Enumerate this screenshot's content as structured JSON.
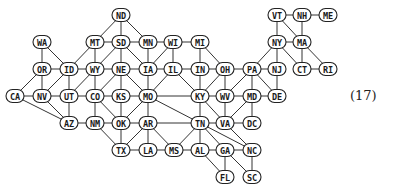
{
  "diagram": {
    "title": "",
    "equation_label": "(17)",
    "style": {
      "node_fill": "#ffffff",
      "node_stroke": "#222222",
      "edge_color": "#333333",
      "text_color": "#1a1a1a"
    },
    "nodes": [
      {
        "id": "ND",
        "x": 121,
        "y": 15
      },
      {
        "id": "WA",
        "x": 42,
        "y": 42
      },
      {
        "id": "MT",
        "x": 95,
        "y": 42
      },
      {
        "id": "SD",
        "x": 121,
        "y": 42
      },
      {
        "id": "MN",
        "x": 148,
        "y": 42
      },
      {
        "id": "WI",
        "x": 173,
        "y": 42
      },
      {
        "id": "MI",
        "x": 200,
        "y": 42
      },
      {
        "id": "VT",
        "x": 277,
        "y": 15
      },
      {
        "id": "NH",
        "x": 302,
        "y": 15
      },
      {
        "id": "ME",
        "x": 328,
        "y": 15
      },
      {
        "id": "NY",
        "x": 277,
        "y": 42
      },
      {
        "id": "MA",
        "x": 302,
        "y": 42
      },
      {
        "id": "OR",
        "x": 42,
        "y": 69
      },
      {
        "id": "ID",
        "x": 69,
        "y": 69
      },
      {
        "id": "WY",
        "x": 95,
        "y": 69
      },
      {
        "id": "NE",
        "x": 121,
        "y": 69
      },
      {
        "id": "IA",
        "x": 148,
        "y": 69
      },
      {
        "id": "IL",
        "x": 173,
        "y": 69
      },
      {
        "id": "IN",
        "x": 200,
        "y": 69
      },
      {
        "id": "OH",
        "x": 225,
        "y": 69
      },
      {
        "id": "PA",
        "x": 252,
        "y": 69
      },
      {
        "id": "NJ",
        "x": 277,
        "y": 69
      },
      {
        "id": "CT",
        "x": 302,
        "y": 69
      },
      {
        "id": "RI",
        "x": 328,
        "y": 69
      },
      {
        "id": "CA",
        "x": 15,
        "y": 96
      },
      {
        "id": "NV",
        "x": 42,
        "y": 96
      },
      {
        "id": "UT",
        "x": 69,
        "y": 96
      },
      {
        "id": "CO",
        "x": 95,
        "y": 96
      },
      {
        "id": "KS",
        "x": 121,
        "y": 96
      },
      {
        "id": "MO",
        "x": 148,
        "y": 96
      },
      {
        "id": "KY",
        "x": 200,
        "y": 96
      },
      {
        "id": "WV",
        "x": 225,
        "y": 96
      },
      {
        "id": "MD",
        "x": 252,
        "y": 96
      },
      {
        "id": "DE",
        "x": 277,
        "y": 96
      },
      {
        "id": "AZ",
        "x": 69,
        "y": 123
      },
      {
        "id": "NM",
        "x": 95,
        "y": 123
      },
      {
        "id": "OK",
        "x": 121,
        "y": 123
      },
      {
        "id": "AR",
        "x": 148,
        "y": 123
      },
      {
        "id": "TN",
        "x": 200,
        "y": 123
      },
      {
        "id": "VA",
        "x": 225,
        "y": 123
      },
      {
        "id": "DC",
        "x": 252,
        "y": 123
      },
      {
        "id": "TX",
        "x": 121,
        "y": 150
      },
      {
        "id": "LA",
        "x": 148,
        "y": 150
      },
      {
        "id": "MS",
        "x": 174,
        "y": 150
      },
      {
        "id": "AL",
        "x": 200,
        "y": 150
      },
      {
        "id": "GA",
        "x": 225,
        "y": 150
      },
      {
        "id": "NC",
        "x": 252,
        "y": 150
      },
      {
        "id": "FL",
        "x": 225,
        "y": 177
      },
      {
        "id": "SC",
        "x": 252,
        "y": 177
      }
    ],
    "edges": [
      [
        "ND",
        "MT"
      ],
      [
        "ND",
        "SD"
      ],
      [
        "ND",
        "MN"
      ],
      [
        "WA",
        "OR"
      ],
      [
        "WA",
        "ID"
      ],
      [
        "MT",
        "SD"
      ],
      [
        "MT",
        "ID"
      ],
      [
        "MT",
        "WY"
      ],
      [
        "SD",
        "MN"
      ],
      [
        "SD",
        "WY"
      ],
      [
        "SD",
        "NE"
      ],
      [
        "SD",
        "IA"
      ],
      [
        "MN",
        "WI"
      ],
      [
        "MN",
        "IA"
      ],
      [
        "WI",
        "MI"
      ],
      [
        "WI",
        "IA"
      ],
      [
        "WI",
        "IL"
      ],
      [
        "MI",
        "IN"
      ],
      [
        "MI",
        "OH"
      ],
      [
        "OR",
        "ID"
      ],
      [
        "OR",
        "CA"
      ],
      [
        "OR",
        "NV"
      ],
      [
        "ID",
        "WY"
      ],
      [
        "ID",
        "NV"
      ],
      [
        "ID",
        "UT"
      ],
      [
        "WY",
        "NE"
      ],
      [
        "WY",
        "UT"
      ],
      [
        "WY",
        "CO"
      ],
      [
        "NE",
        "IA"
      ],
      [
        "NE",
        "CO"
      ],
      [
        "NE",
        "KS"
      ],
      [
        "NE",
        "MO"
      ],
      [
        "IA",
        "IL"
      ],
      [
        "IA",
        "MO"
      ],
      [
        "IL",
        "IN"
      ],
      [
        "IL",
        "MO"
      ],
      [
        "IL",
        "KY"
      ],
      [
        "IN",
        "OH"
      ],
      [
        "IN",
        "KY"
      ],
      [
        "OH",
        "PA"
      ],
      [
        "OH",
        "WV"
      ],
      [
        "OH",
        "KY"
      ],
      [
        "PA",
        "NY"
      ],
      [
        "PA",
        "NJ"
      ],
      [
        "PA",
        "WV"
      ],
      [
        "PA",
        "MD"
      ],
      [
        "PA",
        "DE"
      ],
      [
        "NJ",
        "NY"
      ],
      [
        "NJ",
        "DE"
      ],
      [
        "NY",
        "VT"
      ],
      [
        "NY",
        "MA"
      ],
      [
        "NY",
        "CT"
      ],
      [
        "VT",
        "NH"
      ],
      [
        "VT",
        "MA"
      ],
      [
        "NH",
        "ME"
      ],
      [
        "NH",
        "MA"
      ],
      [
        "MA",
        "CT"
      ],
      [
        "MA",
        "RI"
      ],
      [
        "CT",
        "RI"
      ],
      [
        "CA",
        "NV"
      ],
      [
        "CA",
        "AZ"
      ],
      [
        "NV",
        "UT"
      ],
      [
        "NV",
        "AZ"
      ],
      [
        "UT",
        "CO"
      ],
      [
        "UT",
        "AZ"
      ],
      [
        "CO",
        "KS"
      ],
      [
        "CO",
        "NM"
      ],
      [
        "CO",
        "OK"
      ],
      [
        "KS",
        "MO"
      ],
      [
        "KS",
        "OK"
      ],
      [
        "MO",
        "KY"
      ],
      [
        "MO",
        "TN"
      ],
      [
        "MO",
        "AR"
      ],
      [
        "MO",
        "OK"
      ],
      [
        "KY",
        "WV"
      ],
      [
        "KY",
        "VA"
      ],
      [
        "KY",
        "TN"
      ],
      [
        "WV",
        "MD"
      ],
      [
        "WV",
        "VA"
      ],
      [
        "MD",
        "DE"
      ],
      [
        "MD",
        "VA"
      ],
      [
        "MD",
        "DC"
      ],
      [
        "AZ",
        "NM"
      ],
      [
        "NM",
        "OK"
      ],
      [
        "NM",
        "TX"
      ],
      [
        "OK",
        "AR"
      ],
      [
        "OK",
        "TX"
      ],
      [
        "AR",
        "TN"
      ],
      [
        "AR",
        "TX"
      ],
      [
        "AR",
        "LA"
      ],
      [
        "AR",
        "MS"
      ],
      [
        "TN",
        "VA"
      ],
      [
        "TN",
        "NC"
      ],
      [
        "TN",
        "GA"
      ],
      [
        "TN",
        "AL"
      ],
      [
        "TN",
        "MS"
      ],
      [
        "VA",
        "DC"
      ],
      [
        "VA",
        "NC"
      ],
      [
        "TX",
        "LA"
      ],
      [
        "LA",
        "MS"
      ],
      [
        "MS",
        "AL"
      ],
      [
        "AL",
        "GA"
      ],
      [
        "AL",
        "FL"
      ],
      [
        "GA",
        "NC"
      ],
      [
        "GA",
        "FL"
      ],
      [
        "GA",
        "SC"
      ],
      [
        "NC",
        "SC"
      ]
    ]
  }
}
